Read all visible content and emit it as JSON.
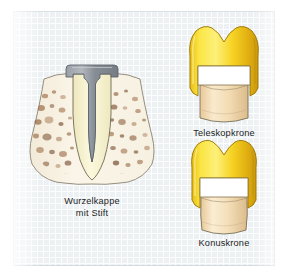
{
  "figure": {
    "language": "de",
    "background_color": "#eef1f3",
    "page_color": "#ffffff",
    "panel": {
      "x": 13,
      "y": 11,
      "width": 262,
      "height": 255,
      "grid": "fine-square-grid"
    }
  },
  "palette": {
    "gold_light": "#fde94a",
    "gold_mid": "#f3cf22",
    "gold_dark": "#d6a815",
    "gold_shadow": "#b98c0d",
    "dentin_cream": "#f7f2cd",
    "tooth_tan": "#f5dcb0",
    "tooth_tan_shade": "#e3c289",
    "bone_base": "#f6efe2",
    "bone_speckle": "#9b6a4a",
    "bone_speckle_dark": "#6f4527",
    "metal_gray": "#8e949c",
    "metal_gray_dark": "#6d737b",
    "outline": "#4a4a48",
    "white_gap": "#ffffff",
    "caption_text": "#1d1d1f"
  },
  "illustrations": [
    {
      "id": "root-cap-with-post",
      "name": "Wurzelkappe mit Stift",
      "caption": "Wurzelkappe\nmit Stift",
      "view": "longitudinal-section",
      "parts": [
        "alveolar-bone",
        "tooth-root",
        "root-canal",
        "metal-root-cap",
        "retention-post"
      ]
    },
    {
      "id": "telescopic-crown",
      "name": "Teleskopkrone",
      "caption": "Teleskopkrone",
      "view": "longitudinal-section",
      "parts": [
        "outer-gold-crown",
        "white-spacing-gap",
        "prepared-tooth-stump"
      ]
    },
    {
      "id": "conical-crown",
      "name": "Konuskrone",
      "caption": "Konuskrone",
      "view": "longitudinal-section",
      "parts": [
        "outer-gold-crown",
        "white-spacing-gap",
        "prepared-tooth-stump"
      ]
    }
  ],
  "captions": {
    "root_cap": "Wurzelkappe\nmit Stift",
    "telescope": "Teleskopkrone",
    "conus": "Konuskrone"
  }
}
